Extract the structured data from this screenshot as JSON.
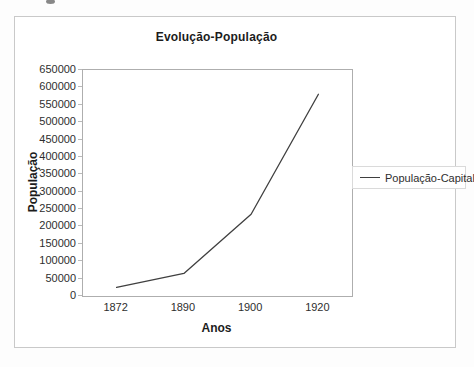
{
  "chart_data": {
    "type": "line",
    "title": "Evolução-População",
    "xlabel": "Anos",
    "ylabel": "População",
    "categories": [
      "1872",
      "1890",
      "1900",
      "1920"
    ],
    "series": [
      {
        "name": "População-Capital",
        "values": [
          25000,
          65000,
          235000,
          580000
        ]
      }
    ],
    "ylim": [
      0,
      650000
    ],
    "ytick_labels": [
      0,
      50000,
      100000,
      150000,
      200000,
      250000,
      300000,
      350000,
      400000,
      450000,
      500000,
      550000,
      600000,
      650000
    ],
    "grid": false,
    "legend_position": "right",
    "line_color": "#3f3f3f"
  }
}
